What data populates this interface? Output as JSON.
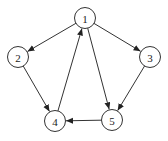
{
  "diagram": {
    "type": "directed-graph",
    "node_radius": 10.5,
    "colors": {
      "stroke": "#333333",
      "fill": "#ffffff",
      "text": "#222222"
    },
    "nodes": [
      {
        "id": "1",
        "label": "1",
        "x": 85,
        "y": 18
      },
      {
        "id": "2",
        "label": "2",
        "x": 18,
        "y": 57
      },
      {
        "id": "3",
        "label": "3",
        "x": 150,
        "y": 57
      },
      {
        "id": "4",
        "label": "4",
        "x": 55,
        "y": 121
      },
      {
        "id": "5",
        "label": "5",
        "x": 112,
        "y": 120
      }
    ],
    "edges": [
      {
        "from": "1",
        "to": "2"
      },
      {
        "from": "1",
        "to": "3"
      },
      {
        "from": "1",
        "to": "5"
      },
      {
        "from": "2",
        "to": "4"
      },
      {
        "from": "3",
        "to": "5"
      },
      {
        "from": "4",
        "to": "1"
      },
      {
        "from": "5",
        "to": "4"
      }
    ]
  }
}
